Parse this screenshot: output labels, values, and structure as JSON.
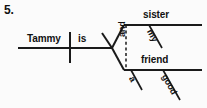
{
  "item": {
    "number": "5."
  },
  "diagram": {
    "type": "reed-kellogg-sentence-diagram",
    "sentence": "Tammy is my sister and a good friend",
    "ink_color": "#1a1a1a",
    "background_color": "#fbfbfb",
    "subject": "Tammy",
    "verb": "is",
    "conjunction": "and",
    "predicate_nominative_upper": "sister",
    "predicate_nominative_upper_modifier": "my",
    "predicate_nominative_lower": "friend",
    "predicate_nominative_lower_modifier_article": "a",
    "predicate_nominative_lower_modifier_adjective": "good"
  }
}
